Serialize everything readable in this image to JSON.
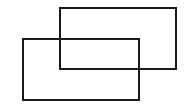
{
  "diagram": {
    "title": "",
    "stroke_color": "#1a1a1a",
    "background": "#ffffff",
    "shapes": [
      {
        "id": "rect-upper-right",
        "type": "rectangle",
        "x": 59,
        "y": 7,
        "width": 118,
        "height": 63
      },
      {
        "id": "rect-lower-left",
        "type": "rectangle",
        "x": 22,
        "y": 38,
        "width": 118,
        "height": 63
      }
    ]
  }
}
